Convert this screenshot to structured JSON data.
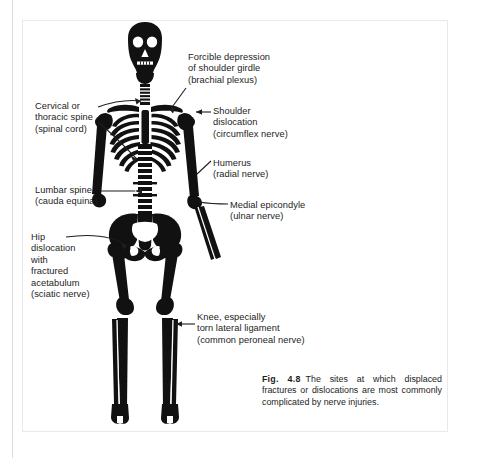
{
  "figure": {
    "labels": [
      {
        "id": "shoulder-girdle",
        "text": "Forcible depression\nof shoulder girdle\n(brachial plexus)"
      },
      {
        "id": "cervical-thoracic-spine",
        "text": "Cervical or\nthoracic spine\n(spinal cord)"
      },
      {
        "id": "shoulder-dislocation",
        "text": "Shoulder\ndislocation\n(circumflex nerve)"
      },
      {
        "id": "humerus",
        "text": "Humerus\n(radial nerve)"
      },
      {
        "id": "lumbar-spine",
        "text": "Lumbar spine\n(cauda equina)"
      },
      {
        "id": "medial-epicondyle",
        "text": "Medial epicondyle\n(ulnar nerve)"
      },
      {
        "id": "hip-dislocation",
        "text": "Hip\ndislocation\nwith\nfractured\nacetabulum\n(sciatic nerve)"
      },
      {
        "id": "knee",
        "text": "Knee, especially\ntorn lateral ligament\n(common peroneal nerve)"
      }
    ],
    "caption": {
      "number": "Fig. 4.8",
      "text": "The sites at which displaced fractures or dislocations are most commonly complicated by nerve injuries."
    },
    "colors": {
      "bone": "#111111",
      "background": "#ffffff",
      "text": "#1d1d1d",
      "panel_border": "#e9e9e9",
      "gutter_rule": "#dcdcdc"
    },
    "illustration": {
      "subject": "human-skeleton-anterior-view",
      "style": "black-silhouette-line-art"
    }
  }
}
